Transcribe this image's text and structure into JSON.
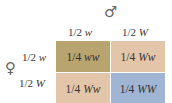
{
  "male_symbol": "♂",
  "female_symbol": "♀",
  "columns": [
    {
      "fraction": "1/2",
      "allele": "w"
    },
    {
      "fraction": "1/2",
      "allele": "W"
    }
  ],
  "rows": [
    {
      "fraction": "1/2",
      "allele": "w"
    },
    {
      "fraction": "1/2",
      "allele": "W"
    }
  ],
  "cells": [
    {
      "fraction": "1/4",
      "genotype": "ww",
      "color": "#b7a46e"
    },
    {
      "fraction": "1/4",
      "genotype": "Ww",
      "color": "#e3c6aa"
    },
    {
      "fraction": "1/4",
      "genotype": "Ww",
      "color": "#e3c6aa"
    },
    {
      "fraction": "1/4",
      "genotype": "WW",
      "color": "#a0b4d4"
    }
  ]
}
